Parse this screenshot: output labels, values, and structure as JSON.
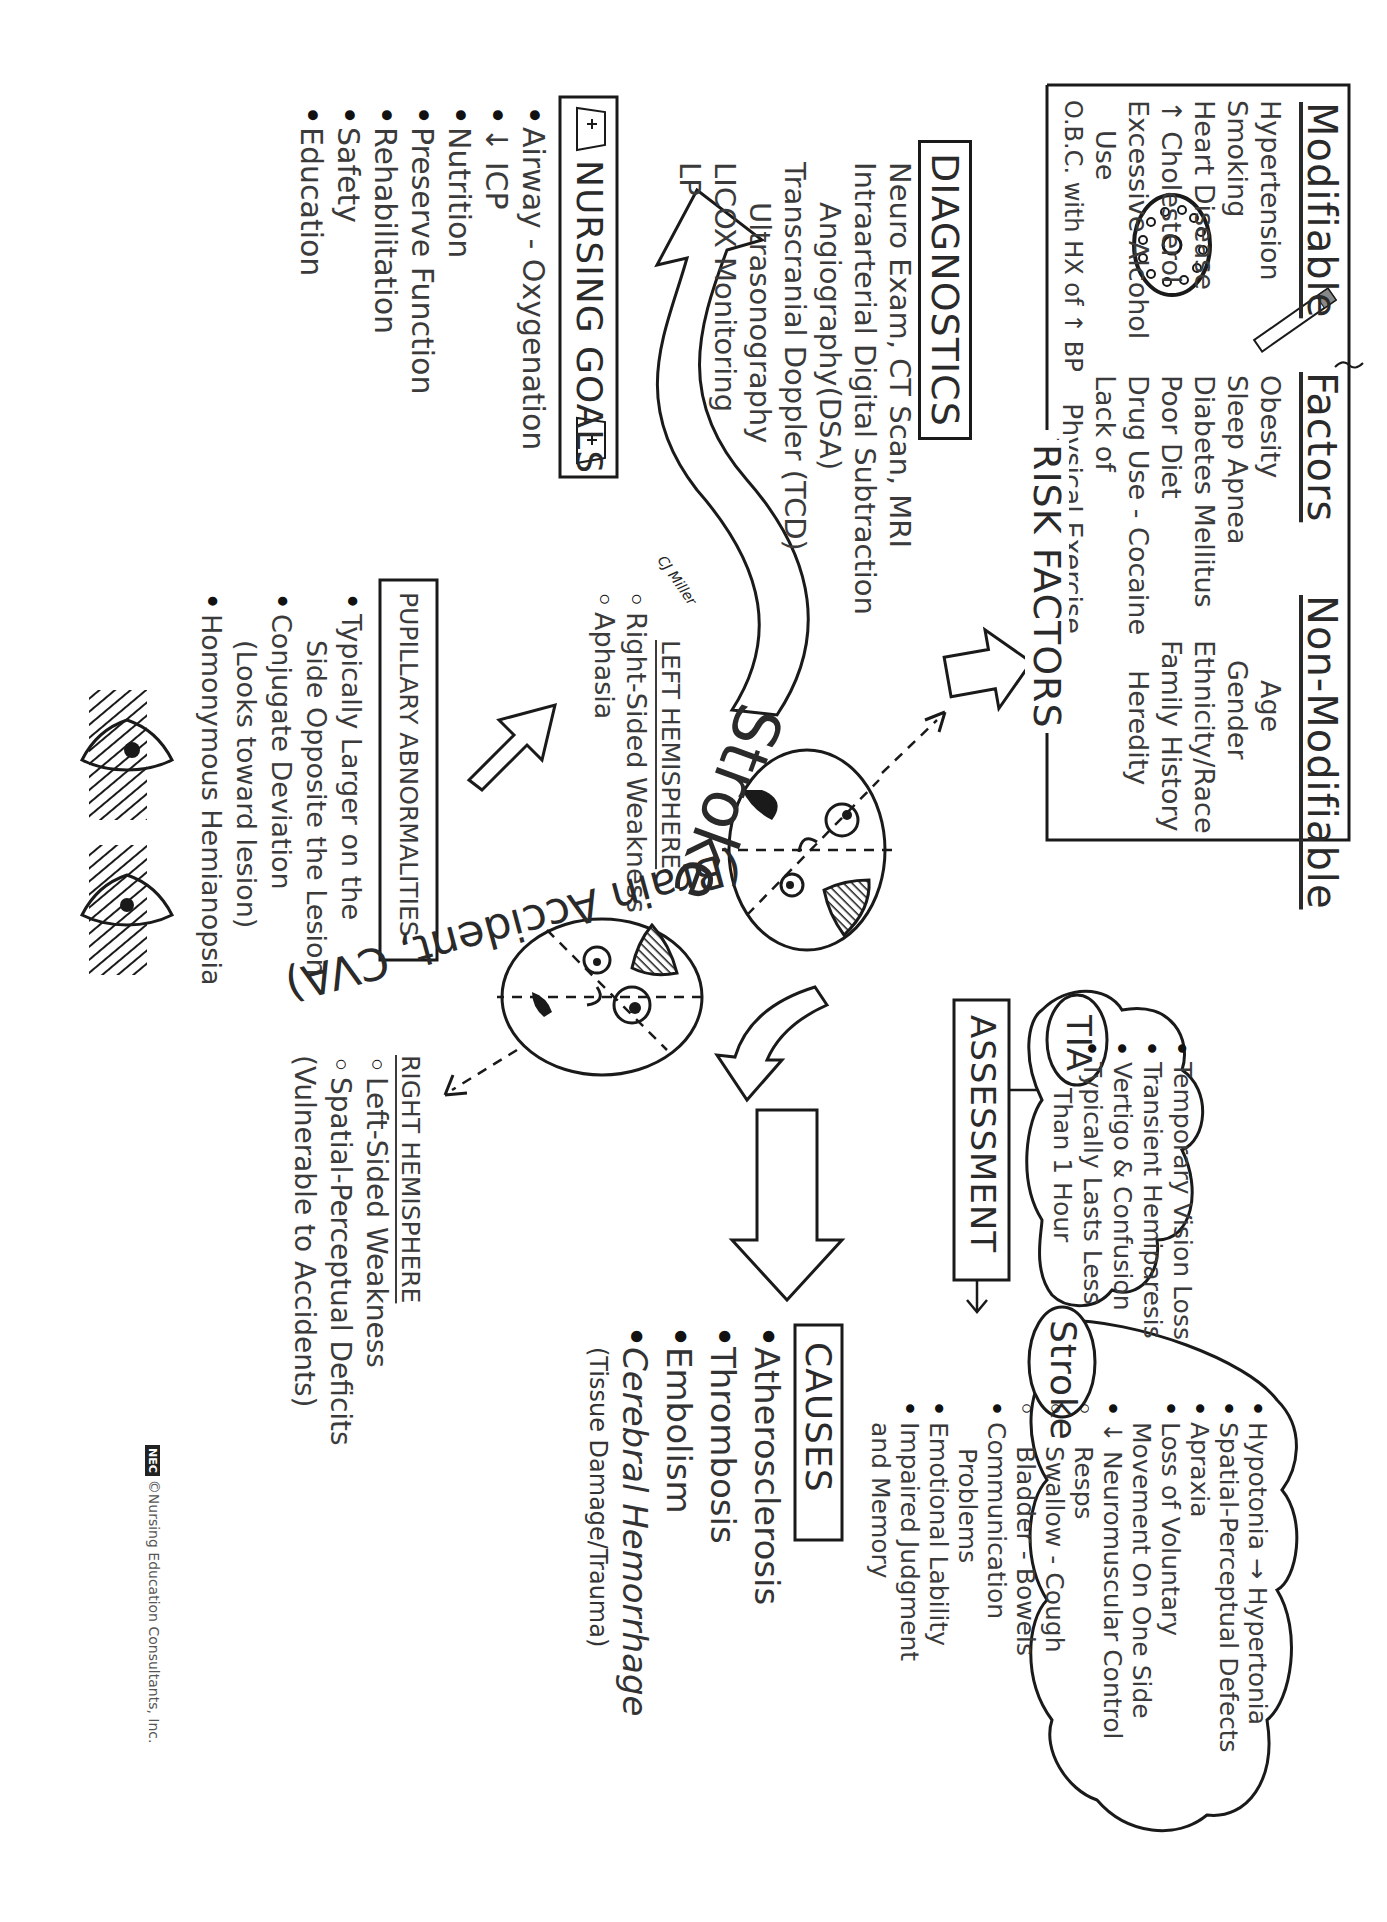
{
  "title": {
    "main": "Stroke",
    "sub": "(Brain Accident, CVA)"
  },
  "risk_factors": {
    "label": "RISK FACTORS",
    "modifiable_heading": "Modifiable",
    "factors_heading": "Factors",
    "non_modifiable_heading": "Non-Modifiable",
    "modifiable_col1": [
      "Hypertension",
      "Smoking",
      "Heart Disease",
      "↑ Cholesterol",
      "Excessive Alcohol",
      "Use",
      "O.B.C. with HX of ↑ BP"
    ],
    "obc_vertical_note": "Oral Birth Control",
    "modifiable_col2": [
      "Obesity",
      "Sleep Apnea",
      "Diabetes Mellitus",
      "Poor Diet",
      "Drug Use - Cocaine",
      "Lack of",
      "Physical Exercise"
    ],
    "non_modifiable": [
      "Age",
      "Gender",
      "Ethnicity/Race",
      "Family History",
      "Heredity"
    ],
    "icons": [
      "cigarette-icon",
      "pill-pack-icon"
    ]
  },
  "diagnostics": {
    "heading": "DIAGNOSTICS",
    "items": [
      "Neuro Exam, CT Scan, MRI",
      "Intraarterial Digital Subtraction",
      "Angiography(DSA)",
      "Transcranial Doppler (TCD)",
      "Ultrasonography",
      "LICOX Monitoring",
      "LP"
    ],
    "signature": "CJ Miller"
  },
  "nursing_goals": {
    "heading": "NURSING GOALS",
    "items": [
      "Airway - Oxygenation",
      "↓ ICP",
      "Nutrition",
      "Preserve Function",
      "Rehabilitation",
      "Safety",
      "Education"
    ],
    "icons": [
      "nurse-cap-icon",
      "nurse-cap-icon"
    ]
  },
  "left_hemisphere": {
    "heading": "LEFT HEMISPHERE",
    "items": [
      "Right-Sided Weakness",
      "Aphasia"
    ]
  },
  "right_hemisphere": {
    "heading": "RIGHT HEMISPHERE",
    "items": [
      "Left-Sided Weakness",
      "Spatial-Perceptual Deficits",
      "(Vulnerable to Accidents)"
    ]
  },
  "pupillary": {
    "heading": "PUPILLARY ABNORMALITIES",
    "items": [
      "Typically Larger on the",
      "Side Opposite the Lesion",
      "Conjugate Deviation",
      "(Looks toward lesion)",
      "Homonymous Hemianopsia"
    ],
    "icons": [
      "eye-hemianopsia-icon",
      "eye-hemianopsia-icon"
    ]
  },
  "assessment": {
    "heading": "ASSESSMENT",
    "tia": {
      "label": "TIA",
      "items": [
        "Temporary Vision Loss",
        "Transient Hemiparesis",
        "Vertigo & Confusion",
        "Typically Lasts Less",
        "Than 1 Hour"
      ]
    },
    "stroke": {
      "label": "Stroke",
      "items": [
        "Hypotonia → Hypertonia",
        "Spatial-Perceptual Defects",
        "Apraxia",
        "Loss of Voluntary",
        "Movement On One Side",
        "↓ Neuromuscular Control",
        "Resps",
        "Swallow - Cough",
        "Bladder - Bowels",
        "Communication",
        "Problems",
        "Emotional Lability",
        "Impaired Judgment",
        "and Memory"
      ]
    }
  },
  "causes": {
    "heading": "CAUSES",
    "items": [
      "Atherosclerosis",
      "Thrombosis",
      "Embolism",
      "Cerebral Hemorrhage",
      "(Tissue Damage/Trauma)"
    ]
  },
  "footer": {
    "logo": "NEC",
    "credit": "©Nursing Education Consultants, Inc."
  },
  "colors": {
    "ink": "#1a1a1a",
    "text": "#3b3b3b",
    "background": "#ffffff"
  }
}
